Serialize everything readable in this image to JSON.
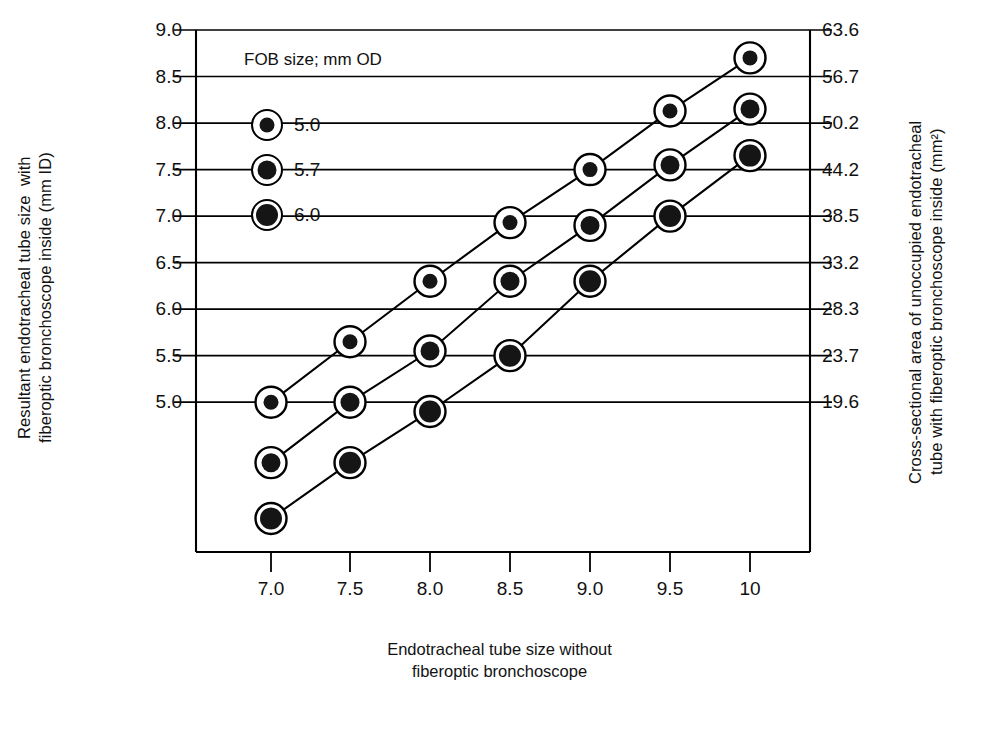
{
  "chart_data": {
    "type": "scatter",
    "title": "",
    "xlabel": "Endotracheal tube size without fiberoptic bronchoscope",
    "xlabel_lines": [
      "Endotracheal tube size without",
      "fiberoptic bronchoscope"
    ],
    "ylabel": "Resultant endotracheal tube size  with fiberoptic bronchoscope inside (mm ID)",
    "ylabel_lines": [
      "Resultant endotracheal tube size  with",
      "fiberoptic bronchoscope inside (mm ID)"
    ],
    "ylabel_right": "Cross-sectional area of unoccupied endotracheal tube with fiberoptic bronchoscope inside (mm²)",
    "ylabel_right_lines": [
      "Cross-sectional area of unoccupied endotracheal",
      "tube with fiberoptic bronchoscope inside (mm²)"
    ],
    "x": [
      7.0,
      7.5,
      8.0,
      8.5,
      9.0,
      9.5,
      10
    ],
    "xtick_labels": [
      "7.0",
      "7.5",
      "8.0",
      "8.5",
      "9.0",
      "9.5",
      "10"
    ],
    "ytick_labels_left": [
      "9.0",
      "8.5",
      "8.0",
      "7.5",
      "7.0",
      "6.5",
      "6.0",
      "5.5",
      "5.0"
    ],
    "ytick_values_left": [
      9.0,
      8.5,
      8.0,
      7.5,
      7.0,
      6.5,
      6.0,
      5.5,
      5.0
    ],
    "ytick_labels_right": [
      "63.6",
      "56.7",
      "50.2",
      "44.2",
      "38.5",
      "33.2",
      "28.3",
      "23.7",
      "19.6"
    ],
    "ytick_values_right": [
      63.6,
      56.7,
      50.2,
      44.2,
      38.5,
      33.2,
      28.3,
      23.7,
      19.6
    ],
    "ylim": [
      3.4,
      9.0
    ],
    "xlim": [
      6.75,
      10.25
    ],
    "grid": "horizontal",
    "legend_position": "top-left-inside",
    "legend_title": "FOB size; mm OD",
    "series": [
      {
        "name": "5.0",
        "label": "5.0",
        "values": [
          5.0,
          5.65,
          6.3,
          6.93,
          7.5,
          8.13,
          8.7
        ]
      },
      {
        "name": "5.7",
        "label": "5.7",
        "values": [
          4.35,
          5.0,
          5.55,
          6.3,
          6.9,
          7.55,
          8.15
        ]
      },
      {
        "name": "6.0",
        "label": "6.0",
        "values": [
          3.75,
          4.35,
          4.9,
          5.5,
          6.3,
          7.0,
          7.65
        ]
      }
    ],
    "colors": {
      "marker_fill": "#151515",
      "marker_ring": "#ffffff",
      "stroke": "#000000",
      "background": "#ffffff"
    }
  },
  "legend": {
    "title": "FOB size; mm OD",
    "items": [
      {
        "label": "5.0"
      },
      {
        "label": "5.7"
      },
      {
        "label": "6.0"
      }
    ]
  },
  "axes": {
    "x_title_line1": "Endotracheal tube size without",
    "x_title_line2": "fiberoptic bronchoscope",
    "y_left_title": "Resultant endotracheal tube size  with\nfiberoptic bronchoscope inside (mm ID)",
    "y_right_title": "Cross-sectional area of unoccupied endotracheal\ntube with fiberoptic bronchoscope inside (mm²)"
  }
}
